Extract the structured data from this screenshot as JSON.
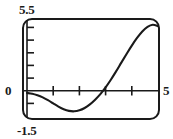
{
  "figure": {
    "name": "graphing-calculator-plot",
    "frame": {
      "x": 22,
      "y": 18,
      "width": 138,
      "height": 102,
      "corner_radius": 9,
      "border_color": "#1a1a1a",
      "border_width": 2.0,
      "background": "#ffffff"
    },
    "labels": {
      "y_max": "5.5",
      "y_min": "-1.5",
      "origin": "0",
      "x_max": "5"
    },
    "axis_color": "#1a1a1a",
    "curve_color": "#1a1a1a"
  },
  "chart_data": {
    "type": "line",
    "title": "",
    "xlabel": "",
    "ylabel": "",
    "xlim": [
      0,
      5
    ],
    "ylim": [
      -1.5,
      5.5
    ],
    "grid": false,
    "legend": null,
    "x_ticks": [
      1,
      2,
      3,
      4
    ],
    "x_tick_labels": [
      "",
      "",
      "",
      ""
    ],
    "y_ticks": [
      -1,
      1,
      2,
      3,
      4,
      5
    ],
    "y_tick_labels": [
      "",
      "",
      "",
      "",
      "",
      ""
    ],
    "x_axis_value": 0,
    "annotations": [
      {
        "text": "5.5",
        "position": "top-left-outside",
        "value": 5.5
      },
      {
        "text": "-1.5",
        "position": "bottom-left-outside",
        "value": -1.5
      },
      {
        "text": "0",
        "position": "origin-left-outside",
        "value": 0
      },
      {
        "text": "5",
        "position": "right-of-axis",
        "value": 5
      }
    ],
    "series": [
      {
        "name": "curve",
        "x": [
          0.0,
          0.2,
          0.4,
          0.6,
          0.8,
          1.0,
          1.2,
          1.4,
          1.6,
          1.8,
          2.0,
          2.2,
          2.4,
          2.6,
          2.8,
          3.0,
          3.2,
          3.4,
          3.6,
          3.8,
          4.0,
          4.2,
          4.4,
          4.6,
          4.8,
          5.0
        ],
        "y": [
          0.3,
          0.24,
          0.13,
          -0.02,
          -0.22,
          -0.45,
          -0.68,
          -0.87,
          -0.99,
          -1.02,
          -0.95,
          -0.78,
          -0.52,
          -0.18,
          0.22,
          0.7,
          1.25,
          1.85,
          2.48,
          3.1,
          3.7,
          4.25,
          4.72,
          5.05,
          5.2,
          5.1
        ]
      }
    ]
  }
}
